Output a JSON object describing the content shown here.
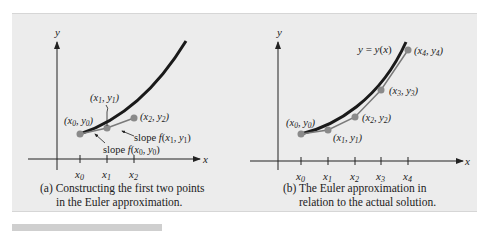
{
  "figure": {
    "panel_a": {
      "caption_line1": "(a) Constructing the first two points",
      "caption_line2": "in the Euler approximation.",
      "axis_x": "x",
      "axis_y": "y",
      "ticks": [
        "x0",
        "x1",
        "x2"
      ],
      "labels": {
        "p0": "(x0, y0)",
        "p1": "(x1, y1)",
        "p2": "(x2, y2)",
        "slope1": "slope f(x1, y1)",
        "slope0": "slope f(x0, y0)"
      }
    },
    "panel_b": {
      "caption_line1": "(b) The Euler approximation in",
      "caption_line2": "relation to the actual solution.",
      "axis_x": "x",
      "axis_y": "y",
      "ticks": [
        "x0",
        "x1",
        "x2",
        "x3",
        "x4"
      ],
      "curve_label": "y = y(x)",
      "labels": {
        "p0": "(x0, y0)",
        "p1": "(x1, y1)",
        "p2": "(x2, y2)",
        "p3": "(x3, y3)",
        "p4": "(x4, y4)"
      }
    },
    "colors": {
      "background": "#ececec",
      "curve": "#1a1a1a",
      "euler_line": "#7a7a7a",
      "point": "#8a8a8a"
    }
  }
}
